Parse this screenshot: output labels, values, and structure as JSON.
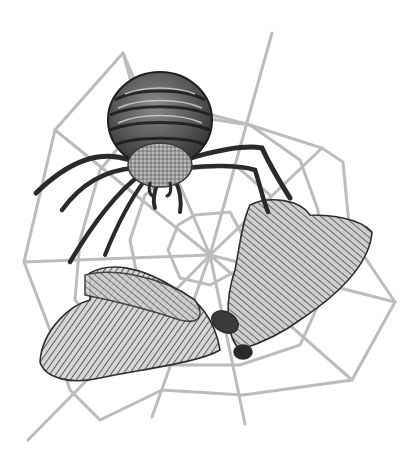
{
  "image": {
    "description": "Grayscale pencil illustration of an orb-weaver spider above a moth caught in a spider web",
    "width": 417,
    "height": 461,
    "style": "grayscale pencil sketch",
    "subjects": [
      {
        "name": "spider",
        "position": "upper center",
        "features": [
          "striped round abdomen",
          "fuzzy cephalothorax",
          "eight long dark legs"
        ]
      },
      {
        "name": "moth",
        "position": "lower center",
        "features": [
          "two large hatched wings spread",
          "dark body at center-right"
        ]
      },
      {
        "name": "spider-web",
        "position": "full image",
        "features": [
          "radial spokes",
          "polygonal spiral rings",
          "hub near center"
        ]
      }
    ],
    "colors": {
      "background": "#ffffff",
      "web": "#b8b8b8",
      "spider_dark": "#2a2a2a",
      "spider_mid": "#6a6a6a",
      "moth_dark": "#3a3a3a",
      "moth_light": "#bdbdbd"
    }
  }
}
